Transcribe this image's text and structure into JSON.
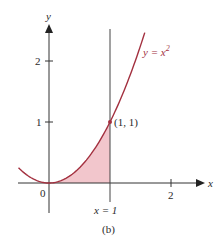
{
  "figure": {
    "caption": "(b)",
    "colors": {
      "curve": "#a3303f",
      "fill": "#f2c6cc",
      "axis": "#333333",
      "text": "#2a2a2a"
    }
  },
  "chart_data": {
    "type": "line",
    "title": "",
    "xlabel": "x",
    "ylabel": "y",
    "xlim": [
      -0.5,
      2.5
    ],
    "ylim": [
      -0.5,
      2.6
    ],
    "grid": false,
    "x_ticks": [
      {
        "value": 2,
        "label": "2"
      }
    ],
    "y_ticks": [
      {
        "value": 1,
        "label": "1"
      },
      {
        "value": 2,
        "label": "2"
      }
    ],
    "origin_label": "0",
    "series": [
      {
        "name": "y = x²",
        "label_base": "y = x",
        "label_sup": "2",
        "function": "x^2",
        "x": [
          -0.5,
          -0.25,
          0,
          0.25,
          0.5,
          0.75,
          1,
          1.25,
          1.5,
          1.57
        ],
        "y": [
          0.25,
          0.0625,
          0,
          0.0625,
          0.25,
          0.5625,
          1,
          1.5625,
          2.25,
          2.46
        ]
      }
    ],
    "shaded_region": {
      "description": "Area under y = x^2 from x = 0 to x = 1",
      "x_from": 0,
      "x_to": 1
    },
    "vertical_line": {
      "x": 1,
      "label": "x = 1"
    },
    "annotations": [
      {
        "text": "(1, 1)",
        "x": 1,
        "y": 1,
        "marker": "point"
      }
    ],
    "caption": "(b)"
  }
}
